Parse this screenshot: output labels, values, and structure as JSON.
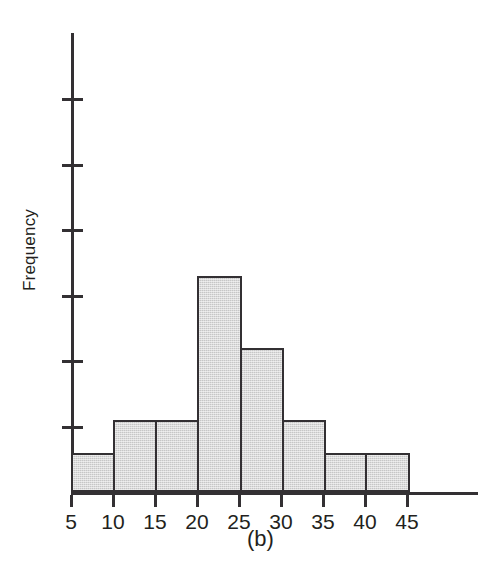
{
  "figure": {
    "caption": "(b)",
    "ylabel": "Frequency",
    "ink_color": "#333033",
    "bar_fill_color": "#c6c6c6",
    "background_color": "#ffffff"
  },
  "chart_data": {
    "type": "bar",
    "title": "",
    "subtitle": "",
    "xlabel": "",
    "ylabel": "Frequency",
    "grid": false,
    "legend": null,
    "annotations": [
      "(b)"
    ],
    "bin_width": 5,
    "bin_edges": [
      5,
      10,
      15,
      20,
      25,
      30,
      35,
      40,
      45
    ],
    "categories": [
      "5-10",
      "10-15",
      "15-20",
      "20-25",
      "25-30",
      "30-35",
      "35-40",
      "40-45"
    ],
    "values": [
      0.6,
      1.1,
      1.1,
      3.3,
      2.2,
      1.1,
      0.6,
      0.6
    ],
    "xtick_labels": [
      "5",
      "10",
      "15",
      "20",
      "25",
      "30",
      "35",
      "40",
      "45"
    ],
    "xtick_values": [
      5,
      10,
      15,
      20,
      25,
      30,
      35,
      40,
      45
    ],
    "xlim": [
      5,
      48
    ],
    "ytick_labels": [
      "",
      "",
      "",
      "",
      "",
      ""
    ],
    "ytick_values": [
      1,
      2,
      3,
      4,
      5,
      6
    ],
    "ylim": [
      0,
      7.05
    ],
    "ytick_count": 6
  }
}
